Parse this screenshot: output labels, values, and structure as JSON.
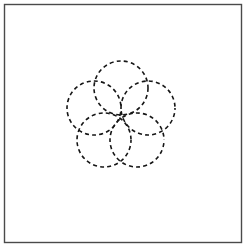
{
  "figure": {
    "canvas": {
      "width": 246,
      "height": 247,
      "background_color": "#ffffff"
    },
    "frame": {
      "name": "outer-border-rectangle",
      "x": 4.5,
      "y": 4.5,
      "width": 237,
      "height": 238,
      "stroke_color": "#4a4a4a",
      "stroke_width": 1.4,
      "fill": "none"
    },
    "rosette": {
      "description": "Five equal circles whose centers lie on a common ring, producing a five-petal flower pattern with a pentagonal void at the middle.",
      "arrangement": "pentagonal",
      "circle_count": 5,
      "pattern_center": {
        "x": 121,
        "y": 122
      },
      "center_ring_radius": 28,
      "circle_radius": 27,
      "stroke_color": "#161616",
      "stroke_width": 1.6,
      "dash_length": 4,
      "gap_length": 3.2,
      "circles": [
        {
          "name": "circle-top",
          "label": "Top circle",
          "cx": 121,
          "cy": 88,
          "r": 27,
          "dash_offset": 0
        },
        {
          "name": "circle-upper-right",
          "label": "Upper-right circle",
          "cx": 148,
          "cy": 108,
          "r": 27,
          "dash_offset": 2
        },
        {
          "name": "circle-lower-right",
          "label": "Lower-right circle",
          "cx": 137,
          "cy": 140,
          "r": 27,
          "dash_offset": 4
        },
        {
          "name": "circle-lower-left",
          "label": "Lower-left circle",
          "cx": 104,
          "cy": 140,
          "r": 27,
          "dash_offset": 1
        },
        {
          "name": "circle-upper-left",
          "label": "Upper-left circle",
          "cx": 94,
          "cy": 108,
          "r": 27,
          "dash_offset": 3
        }
      ]
    }
  }
}
